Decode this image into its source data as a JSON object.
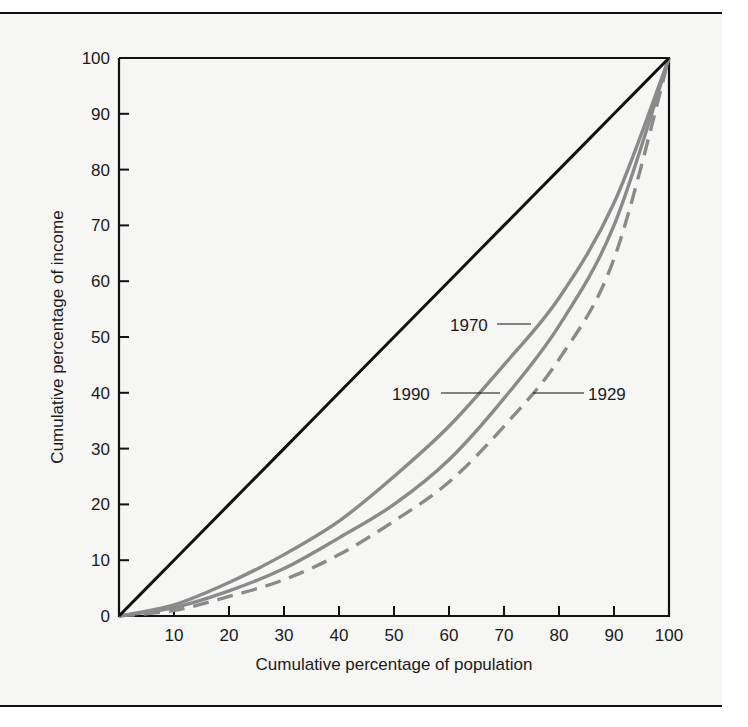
{
  "chart_data": {
    "type": "line",
    "title": "",
    "xlabel": "Cumulative percentage of population",
    "ylabel": "Cumulative percentage of income",
    "xlim": [
      0,
      100
    ],
    "ylim": [
      0,
      100
    ],
    "x_ticks": [
      "10",
      "20",
      "30",
      "40",
      "50",
      "60",
      "70",
      "80",
      "90",
      "100"
    ],
    "y_ticks": [
      "0",
      "10",
      "20",
      "30",
      "40",
      "50",
      "60",
      "70",
      "80",
      "90",
      "100"
    ],
    "grid": false,
    "legend": "inline labels",
    "x": [
      0,
      10,
      20,
      30,
      40,
      50,
      60,
      70,
      80,
      90,
      100
    ],
    "series": [
      {
        "name": "Line of equality",
        "style": "solid",
        "color": "#111111",
        "values": [
          0,
          10,
          20,
          30,
          40,
          50,
          60,
          70,
          80,
          90,
          100
        ]
      },
      {
        "name": "1970",
        "style": "solid",
        "color": "#8a8a8a",
        "values": [
          0,
          2,
          6,
          11,
          17,
          25,
          34,
          45,
          57,
          74,
          100
        ]
      },
      {
        "name": "1990",
        "style": "solid",
        "color": "#8a8a8a",
        "values": [
          0,
          1.5,
          4.5,
          8.5,
          14,
          20,
          28,
          39,
          52,
          70,
          100
        ]
      },
      {
        "name": "1929",
        "style": "dashed",
        "color": "#8a8a8a",
        "values": [
          0,
          1,
          3.5,
          6.5,
          11,
          17,
          24,
          34,
          46,
          64,
          100
        ]
      }
    ],
    "annotations": [
      {
        "text": "1970",
        "points_to": "1970 curve",
        "at": [
          65,
          52
        ]
      },
      {
        "text": "1990",
        "points_to": "1990 curve",
        "at": [
          70,
          40
        ]
      },
      {
        "text": "1929",
        "points_to": "1929 curve",
        "at": [
          75,
          40
        ]
      }
    ]
  },
  "labels": {
    "xlabel": "Cumulative percentage of population",
    "ylabel": "Cumulative percentage of income",
    "y_ticks": [
      "100",
      "90",
      "80",
      "70",
      "60",
      "50",
      "40",
      "30",
      "20",
      "10",
      "0"
    ],
    "x_ticks": [
      "10",
      "20",
      "30",
      "40",
      "50",
      "60",
      "70",
      "80",
      "90",
      "100"
    ],
    "ann_1970": "1970",
    "ann_1990": "1990",
    "ann_1929": "1929"
  }
}
